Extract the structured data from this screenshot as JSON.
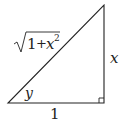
{
  "diagram": {
    "type": "right-triangle",
    "vertices": {
      "bottom_left": [
        8,
        103
      ],
      "bottom_right": [
        104,
        103
      ],
      "top": [
        104,
        5
      ]
    },
    "labels": {
      "hypotenuse_radicand_one": "1",
      "hypotenuse_plus": "+",
      "hypotenuse_var": "x",
      "hypotenuse_exp": "2",
      "opposite": "x",
      "angle": "y",
      "adjacent": "1"
    },
    "colors": {
      "stroke": "#222222",
      "background": "#ffffff"
    }
  }
}
